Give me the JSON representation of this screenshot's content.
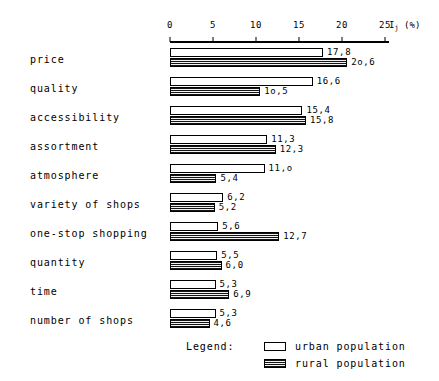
{
  "chart_data": {
    "type": "bar",
    "orientation": "horizontal",
    "title": "",
    "xlabel": "I_j (%)",
    "ylabel": "",
    "xlim": [
      0,
      27
    ],
    "grid": false,
    "axis_ticks": [
      "0",
      "5",
      "10",
      "15",
      "20",
      "25"
    ],
    "axis_tick_values": [
      0,
      5,
      10,
      15,
      20,
      25
    ],
    "axis_unit_label": "I",
    "axis_unit_subscript": "j",
    "axis_unit_suffix": " (%)",
    "legend_position": "bottom",
    "categories": [
      "price",
      "quality",
      "accessibility",
      "assortment",
      "atmosphere",
      "variety of shops",
      "one-stop shopping",
      "quantity",
      "time",
      "number of shops"
    ],
    "series": [
      {
        "name": "urban population",
        "values": [
          17.8,
          16.6,
          15.4,
          11.3,
          11.0,
          6.2,
          5.6,
          5.5,
          5.3,
          5.3
        ],
        "labels": [
          "17,8",
          "16,6",
          "15,4",
          "11,3",
          "11,o",
          "6,2",
          "5,6",
          "5,5",
          "5,3",
          "5,3"
        ]
      },
      {
        "name": "rural population",
        "values": [
          20.6,
          10.5,
          15.8,
          12.3,
          5.4,
          5.2,
          12.7,
          6.0,
          6.9,
          4.6
        ],
        "labels": [
          "2o,6",
          "1o,5",
          "15,8",
          "12,3",
          "5,4",
          "5,2",
          "12,7",
          "6,0",
          "6,9",
          "4,6"
        ]
      }
    ]
  },
  "legend": {
    "title": "Legend:",
    "entries": [
      {
        "label": "urban population",
        "swatch": "hollow-white"
      },
      {
        "label": "rural population",
        "swatch": "dark-striped"
      }
    ]
  },
  "colors": {
    "urban_fill": "#ffffff",
    "rural_fill": "#141414",
    "outline": "#000000",
    "background": "#ffffff"
  }
}
